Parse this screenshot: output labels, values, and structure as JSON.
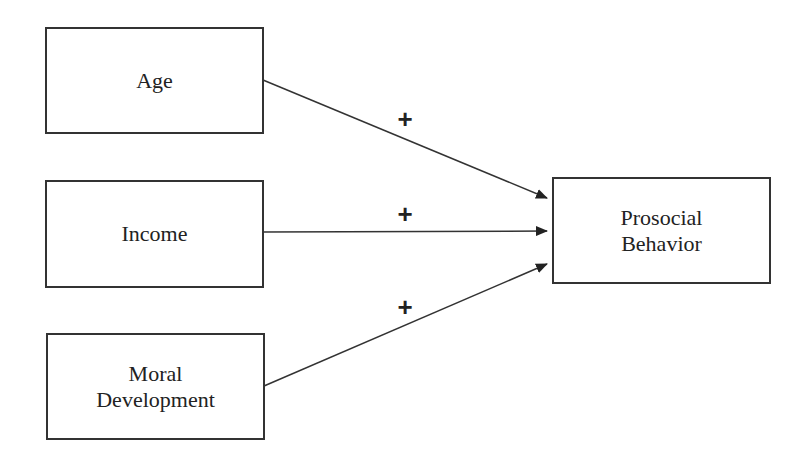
{
  "nodes": {
    "age": {
      "label": "Age"
    },
    "income": {
      "label": "Income"
    },
    "moral": {
      "line1": "Moral",
      "line2": "Development"
    },
    "prosocial": {
      "line1": "Prosocial",
      "line2": "Behavior"
    }
  },
  "edges": [
    {
      "from": "Age",
      "to": "Prosocial Behavior",
      "sign": "+"
    },
    {
      "from": "Income",
      "to": "Prosocial Behavior",
      "sign": "+"
    },
    {
      "from": "Moral Development",
      "to": "Prosocial Behavior",
      "sign": "+"
    }
  ]
}
